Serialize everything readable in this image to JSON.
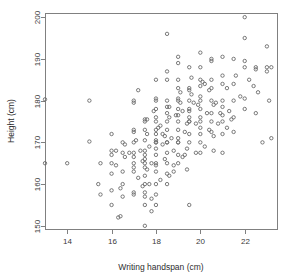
{
  "chart_data": {
    "type": "scatter",
    "title": "",
    "xlabel": "Writing handspan (cm)",
    "ylabel": "Height (cm)",
    "xlim": [
      13.0,
      23.5
    ],
    "ylim": [
      149.0,
      201.0
    ],
    "xticks": [
      14,
      16,
      18,
      20,
      22
    ],
    "yticks": [
      150,
      160,
      170,
      180,
      190,
      200
    ],
    "xtick_labels": [
      "14",
      "16",
      "18",
      "20",
      "22"
    ],
    "ytick_labels": [
      "150",
      "160",
      "170",
      "180",
      "190",
      "200"
    ],
    "grid": false,
    "legend": "none",
    "point_marker": "open-circle",
    "point_color": "#6a6a6a",
    "n_points": 232,
    "x": [
      13.0,
      13.0,
      14.0,
      15.0,
      15.0,
      15.4,
      15.5,
      15.5,
      16.0,
      16.0,
      16.0,
      16.0,
      16.0,
      16.0,
      16.0,
      16.2,
      16.3,
      16.4,
      16.4,
      16.5,
      16.5,
      16.5,
      16.5,
      16.5,
      16.6,
      17.0,
      17.0,
      17.0,
      17.0,
      17.0,
      17.0,
      17.0,
      17.0,
      17.0,
      17.0,
      17.0,
      17.2,
      17.3,
      17.4,
      17.5,
      17.5,
      17.5,
      17.5,
      17.5,
      17.5,
      17.5,
      17.5,
      17.5,
      17.5,
      17.5,
      17.5,
      17.5,
      17.5,
      17.6,
      17.6,
      17.7,
      17.8,
      17.8,
      18.0,
      18.0,
      18.0,
      18.0,
      18.0,
      18.0,
      18.0,
      18.0,
      18.0,
      18.0,
      18.0,
      18.0,
      18.0,
      18.0,
      18.0,
      18.0,
      18.0,
      18.0,
      18.2,
      18.3,
      18.4,
      18.5,
      18.5,
      18.5,
      18.5,
      18.5,
      18.5,
      18.5,
      18.5,
      18.5,
      18.5,
      18.5,
      18.5,
      18.5,
      18.6,
      18.7,
      18.8,
      18.8,
      19.0,
      19.0,
      19.0,
      19.0,
      19.0,
      19.0,
      19.0,
      19.0,
      19.0,
      19.0,
      19.0,
      19.0,
      19.0,
      19.0,
      19.1,
      19.2,
      19.3,
      19.4,
      19.5,
      19.5,
      19.5,
      19.5,
      19.5,
      19.5,
      19.5,
      19.5,
      19.5,
      19.5,
      19.5,
      19.6,
      19.7,
      19.8,
      20.0,
      20.0,
      20.0,
      20.0,
      20.0,
      20.0,
      20.0,
      20.0,
      20.0,
      20.0,
      20.0,
      20.0,
      20.2,
      20.3,
      20.4,
      20.5,
      20.5,
      20.5,
      20.5,
      20.5,
      20.5,
      20.5,
      20.5,
      20.6,
      20.8,
      21.0,
      21.0,
      21.0,
      21.0,
      21.0,
      21.0,
      21.0,
      21.0,
      21.0,
      21.2,
      21.3,
      21.5,
      21.5,
      21.5,
      21.5,
      21.5,
      21.6,
      21.8,
      22.0,
      22.0,
      22.0,
      22.0,
      22.0,
      22.0,
      22.2,
      22.4,
      22.5,
      22.5,
      22.5,
      22.6,
      22.8,
      23.0,
      23.0,
      23.0,
      23.1,
      23.2,
      23.2,
      16.8,
      17.1,
      17.6,
      17.9,
      18.1,
      18.4,
      18.6,
      18.9,
      19.1,
      19.4,
      19.6,
      19.9,
      20.1,
      20.4,
      20.6,
      20.9,
      16.2,
      16.6,
      17.2,
      17.4,
      17.8,
      18.2,
      18.6,
      18.8,
      19.2,
      19.4,
      19.8,
      20.2,
      20.6,
      21.2,
      21.4,
      18.0,
      18.5,
      19.0,
      17.5,
      17.0,
      19.5,
      20.0,
      18.3,
      17.7,
      19.3,
      20.7
    ],
    "y": [
      180.3,
      165.0,
      165.0,
      170.2,
      180.0,
      160.0,
      165.0,
      157.5,
      165.0,
      167.0,
      172.0,
      168.0,
      155.0,
      162.5,
      158.5,
      168.0,
      152.0,
      152.3,
      159.0,
      167.5,
      170.0,
      163.0,
      160.0,
      157.0,
      169.5,
      180.0,
      179.5,
      173.0,
      170.0,
      167.5,
      166.5,
      164.0,
      163.0,
      158.0,
      157.5,
      172.5,
      182.5,
      168.0,
      165.5,
      175.5,
      175.0,
      173.0,
      170.5,
      168.0,
      167.0,
      166.0,
      164.0,
      162.0,
      160.0,
      158.0,
      157.0,
      155.0,
      150.0,
      172.0,
      163.5,
      169.0,
      153.5,
      165.0,
      185.0,
      180.5,
      180.0,
      178.0,
      176.0,
      175.0,
      173.0,
      172.0,
      170.5,
      170.0,
      168.5,
      167.0,
      165.0,
      164.5,
      163.0,
      160.0,
      157.5,
      155.0,
      174.0,
      169.5,
      166.0,
      196.0,
      187.0,
      185.0,
      180.0,
      178.5,
      177.0,
      175.0,
      173.0,
      170.0,
      167.5,
      165.0,
      162.5,
      160.0,
      176.0,
      171.0,
      168.0,
      163.0,
      190.5,
      189.0,
      185.0,
      183.0,
      180.5,
      180.0,
      178.0,
      176.5,
      175.0,
      173.0,
      171.0,
      170.0,
      167.0,
      165.0,
      182.0,
      177.5,
      172.5,
      168.5,
      188.0,
      183.0,
      182.5,
      180.0,
      178.0,
      177.5,
      176.0,
      175.0,
      172.0,
      170.0,
      155.0,
      185.5,
      179.5,
      174.5,
      191.5,
      188.0,
      185.0,
      183.5,
      181.0,
      180.0,
      178.0,
      176.0,
      173.5,
      172.0,
      170.0,
      167.5,
      184.0,
      177.0,
      173.0,
      190.0,
      189.5,
      185.0,
      183.0,
      180.0,
      177.0,
      175.0,
      172.5,
      168.0,
      174.5,
      190.5,
      186.0,
      184.0,
      180.0,
      178.5,
      176.5,
      175.0,
      172.0,
      167.5,
      183.0,
      177.5,
      190.0,
      184.0,
      180.0,
      176.0,
      172.5,
      186.0,
      181.0,
      200.0,
      195.0,
      189.5,
      188.0,
      180.5,
      178.0,
      185.0,
      183.5,
      188.0,
      187.5,
      177.0,
      182.0,
      170.0,
      193.0,
      188.0,
      187.0,
      180.0,
      188.0,
      171.0,
      167.5,
      170.5,
      175.5,
      177.5,
      173.5,
      171.5,
      178.5,
      176.5,
      179.5,
      174.5,
      181.5,
      179.0,
      184.5,
      182.5,
      179.0,
      177.0,
      164.5,
      166.5,
      161.5,
      159.5,
      156.5,
      161.0,
      162.0,
      164.5,
      166.5,
      163.5,
      167.5,
      169.0,
      171.5,
      173.5,
      175.5,
      170.0,
      170.0,
      170.0,
      165.0,
      165.0,
      175.0,
      175.0,
      172.0,
      160.0,
      167.0,
      179.5
    ]
  },
  "plot_area": {
    "left_px": 45,
    "top_px": 13,
    "right_px": 278,
    "bottom_px": 230
  }
}
